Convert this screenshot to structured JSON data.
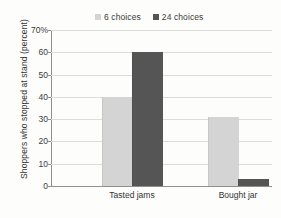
{
  "chart_data": {
    "type": "bar",
    "title": "",
    "xlabel": "",
    "ylabel": "Shoppers who stopped at stand (percent)",
    "categories": [
      "Tasted jams",
      "Bought jar"
    ],
    "series": [
      {
        "name": "6 choices",
        "values": [
          40,
          31
        ],
        "color": "#d4d4d4"
      },
      {
        "name": "24 choices",
        "values": [
          60,
          3
        ],
        "color": "#555555"
      }
    ],
    "ylim": [
      0,
      70
    ],
    "yticks": [
      0,
      10,
      20,
      30,
      40,
      50,
      60,
      70
    ],
    "ytick_labels": [
      "0",
      "10",
      "20",
      "30",
      "40",
      "50",
      "60",
      "70%"
    ],
    "grid": true,
    "legend_position": "top"
  },
  "legend": {
    "entries": [
      {
        "label": "6 choices"
      },
      {
        "label": "24 choices"
      }
    ]
  },
  "axis": {
    "y_title": "Shoppers who stopped at stand (percent)"
  },
  "colors": {
    "series_light": "#d4d4d4",
    "series_dark": "#555555",
    "gridline": "#dcdcdc",
    "axis": "#8f8f8f",
    "text": "#333333",
    "background": "#fdfdfc"
  }
}
